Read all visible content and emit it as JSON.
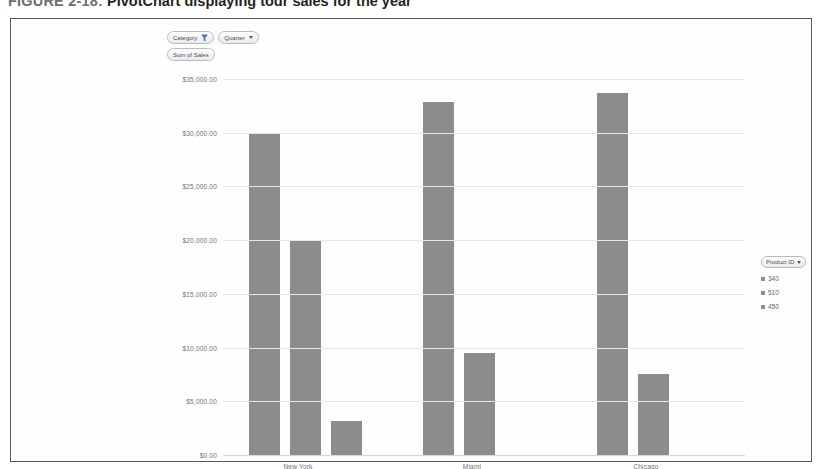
{
  "caption": {
    "label": "FIGURE 2-18:",
    "text": "PivotChart displaying tour sales for the year"
  },
  "chart_data": {
    "type": "bar",
    "title": "",
    "xlabel": "",
    "ylabel": "",
    "value_field": "Sum of Sales",
    "filters": [
      {
        "label": "Category",
        "icon": "funnel-icon"
      },
      {
        "label": "Quarter",
        "icon": "chevron-down-icon"
      }
    ],
    "legend": {
      "title": "Product ID",
      "position": "right",
      "entries": [
        "340",
        "510",
        "450"
      ]
    },
    "categories": [
      "New York",
      "Miami",
      "Chicago"
    ],
    "series": [
      {
        "name": "340",
        "values": [
          30000,
          32900,
          33700
        ]
      },
      {
        "name": "510",
        "values": [
          20000,
          9500,
          7500
        ]
      },
      {
        "name": "450",
        "values": [
          3200,
          null,
          null
        ]
      }
    ],
    "ylim": [
      0,
      35000
    ],
    "ytick_values": [
      0,
      5000,
      10000,
      15000,
      20000,
      25000,
      30000,
      35000
    ],
    "ytick_labels": [
      "$0.00",
      "$5,000.00",
      "$10,000.00",
      "$15,000.00",
      "$20,000.00",
      "$25,000.00",
      "$30,000.00",
      "$35,000.00"
    ],
    "grid": true,
    "bar_color": "#8b8c8e"
  }
}
